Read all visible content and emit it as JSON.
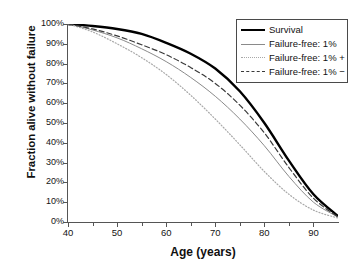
{
  "chart_data": {
    "type": "line",
    "title": "",
    "xlabel": "Age (years)",
    "ylabel": "Fraction alive without failure",
    "xlim": [
      40,
      95
    ],
    "ylim": [
      0,
      100
    ],
    "grid": false,
    "legend_position": "top-right",
    "x_ticks": [
      "40",
      "50",
      "60",
      "70",
      "80",
      "90"
    ],
    "x_tick_values": [
      40,
      50,
      60,
      70,
      80,
      90
    ],
    "y_ticks": [
      "0%",
      "10%",
      "20%",
      "30%",
      "40%",
      "50%",
      "60%",
      "70%",
      "80%",
      "90%",
      "100%"
    ],
    "y_tick_values": [
      0,
      10,
      20,
      30,
      40,
      50,
      60,
      70,
      80,
      90,
      100
    ],
    "x": [
      40,
      45,
      50,
      55,
      60,
      65,
      70,
      75,
      80,
      85,
      90,
      95
    ],
    "series": [
      {
        "name": "Survival",
        "style": "solid-thick",
        "color": "#000000",
        "values": [
          100,
          99,
          97.5,
          95,
          90.5,
          85,
          77.5,
          66,
          50,
          31,
          14,
          3
        ]
      },
      {
        "name": "Failure-free: 1%",
        "style": "solid-thin",
        "color": "#8a8a8a",
        "values": [
          100,
          97,
          93,
          87.5,
          81,
          73,
          63.5,
          52,
          38.5,
          23,
          10,
          2.5
        ]
      },
      {
        "name": "Failure-free: 1% +",
        "style": "dotted",
        "color": "#a8a8a8",
        "values": [
          100,
          96,
          90,
          83,
          74.5,
          64,
          52,
          39,
          25.5,
          14,
          6,
          2
        ]
      },
      {
        "name": "Failure-free: 1% −",
        "style": "dashed",
        "color": "#3a3a3a",
        "values": [
          100,
          97.5,
          94,
          89.5,
          84.5,
          78,
          70,
          59,
          45,
          27.5,
          12,
          2.5
        ]
      }
    ]
  },
  "legend": {
    "items": [
      {
        "label": "Survival"
      },
      {
        "label": "Failure-free: 1%"
      },
      {
        "label": "Failure-free: 1% +"
      },
      {
        "label": "Failure-free: 1% −"
      }
    ]
  }
}
